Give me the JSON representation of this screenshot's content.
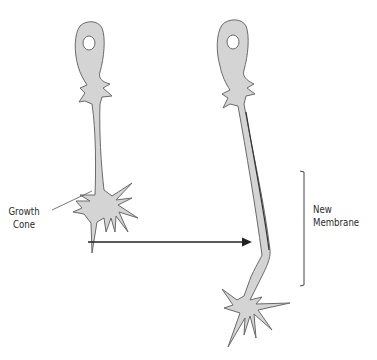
{
  "diagram": {
    "type": "neuron-growth-illustration",
    "colors": {
      "cell_fill": "#d4d4d4",
      "cell_outline": "#6a6a6a",
      "arrow": "#222222",
      "text": "#2a2a2a",
      "background": "#ffffff"
    },
    "labels": {
      "growth_cone_line1": "Growth",
      "growth_cone_line2": "Cone",
      "new_membrane_line1": "New",
      "new_membrane_line2": "Membrane"
    },
    "panels": [
      {
        "name": "before",
        "description": "Neuron with short neurite ending in growth cone"
      },
      {
        "name": "after",
        "description": "Neuron with elongated neurite; new membrane added at growth cone"
      }
    ],
    "arrow": {
      "direction": "right",
      "from_x": 88,
      "to_x": 252,
      "y": 242
    }
  }
}
